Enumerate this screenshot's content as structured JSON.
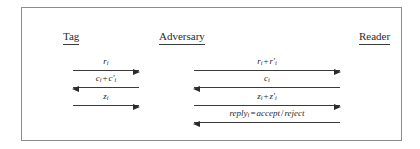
{
  "figure": {
    "border_color": "#8c8c8c",
    "ink_color": "#2b2b2b",
    "background": "#ffffff"
  },
  "parties": [
    {
      "id": "tag",
      "label": "Tag"
    },
    {
      "id": "adversary",
      "label": "Adversary"
    },
    {
      "id": "reader",
      "label": "Reader"
    }
  ],
  "messages": {
    "tag_adversary": [
      {
        "label": "r_i",
        "direction": "right",
        "from": "tag",
        "to": "adversary"
      },
      {
        "label": "c_i + c'_i",
        "direction": "left",
        "from": "adversary",
        "to": "tag"
      },
      {
        "label": "z_i",
        "direction": "right",
        "from": "tag",
        "to": "adversary"
      }
    ],
    "adversary_reader": [
      {
        "label": "r_i + r'_i",
        "direction": "right",
        "from": "adversary",
        "to": "reader"
      },
      {
        "label": "c_i",
        "direction": "left",
        "from": "reader",
        "to": "adversary"
      },
      {
        "label": "z_i + z'_i",
        "direction": "right",
        "from": "adversary",
        "to": "reader"
      },
      {
        "label": "reply_i = accept/reject",
        "direction": "left",
        "from": "reader",
        "to": "adversary"
      }
    ]
  }
}
